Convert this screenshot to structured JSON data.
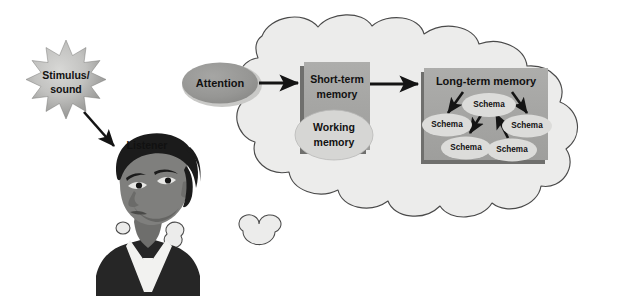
{
  "diagram": {
    "title_alt": "Information processing model: stimulus to long-term memory",
    "colors": {
      "background": "#ffffff",
      "cloud_fill": "#ececeb",
      "cloud_stroke": "#4a4a4a",
      "star_light": "#d2d2d0",
      "star_dark": "#8e8e8c",
      "star_stroke": "#6e6e6c",
      "attention_fill": "#9a9a98",
      "attention_halo": "#c9c9c7",
      "box_fill": "#a8a8a6",
      "box_shadow": "#6f6f6d",
      "working_fill": "#d6d6d4",
      "schema_fill": "#dcdcda",
      "arrow": "#141414",
      "text": "#111111",
      "hair": "#1b1b1b",
      "skin": "#7f7f7d",
      "skin_shadow": "#606060",
      "collar": "#f2f2f0",
      "shirt": "#262626"
    },
    "stimulus": {
      "label_line1": "Stimulus/",
      "label_line2": "sound",
      "shape": "starburst-12-point"
    },
    "listener": {
      "label": "Listener",
      "shape": "person-head-illustration"
    },
    "thought_bubbles": [
      {
        "name": "thought-bubble-small"
      },
      {
        "name": "thought-bubble-medium"
      },
      {
        "name": "thought-bubble-large"
      }
    ],
    "cloud": {
      "name": "thought-cloud"
    },
    "attention": {
      "label": "Attention"
    },
    "short_term_memory": {
      "label_line1": "Short-term",
      "label_line2": "memory"
    },
    "working_memory": {
      "label_line1": "Working",
      "label_line2": "memory"
    },
    "long_term_memory": {
      "title": "Long-term memory",
      "schemas": [
        {
          "id": "schema-top-center",
          "label": "Schema"
        },
        {
          "id": "schema-left",
          "label": "Schema"
        },
        {
          "id": "schema-right",
          "label": "Schema"
        },
        {
          "id": "schema-bottom-left",
          "label": "Schema"
        },
        {
          "id": "schema-bottom-center",
          "label": "Schema"
        }
      ]
    },
    "arrows": [
      {
        "id": "arrow-stimulus-to-listener",
        "from": "stimulus",
        "to": "listener"
      },
      {
        "id": "arrow-attention-to-stm",
        "from": "attention",
        "to": "short-term-memory"
      },
      {
        "id": "arrow-stm-to-ltm",
        "from": "short-term-memory",
        "to": "long-term-memory"
      },
      {
        "id": "arrow-ltm-title-to-schema-left",
        "from": "long-term-memory-title",
        "to": "schema-left"
      },
      {
        "id": "arrow-ltm-title-to-schema-right",
        "from": "long-term-memory-title",
        "to": "schema-right"
      },
      {
        "id": "arrow-schema-top-to-bottom-left",
        "from": "schema-top-center",
        "to": "schema-bottom-left"
      },
      {
        "id": "arrow-schema-bottom-center-to-top",
        "from": "schema-bottom-center",
        "to": "schema-top-center"
      }
    ]
  }
}
